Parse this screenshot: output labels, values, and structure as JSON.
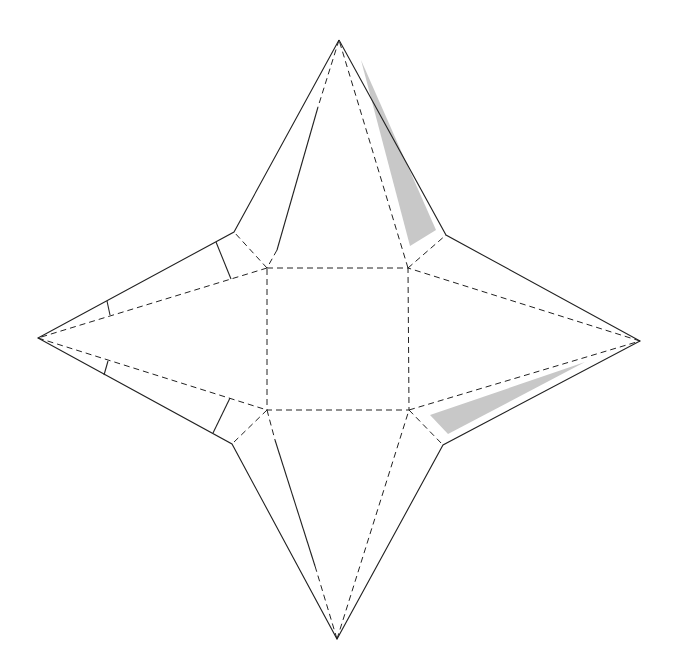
{
  "diagram": {
    "type": "net",
    "colors": {
      "line": "#222222",
      "shade": "#c8c8c8",
      "background": "#ffffff"
    },
    "square": {
      "corners": [
        [
          267,
          268
        ],
        [
          408,
          268
        ],
        [
          409,
          410
        ],
        [
          267,
          410
        ]
      ]
    },
    "tips": {
      "top": [
        339,
        40
      ],
      "right": [
        640,
        341
      ],
      "bottom": [
        337,
        639
      ],
      "left": [
        38,
        338
      ]
    },
    "outer_vertices": {
      "top_left": [
        234,
        232
      ],
      "top_right": [
        446,
        235
      ],
      "bottom_right": [
        443,
        445
      ],
      "bottom_left": [
        232,
        444
      ]
    },
    "shaded_regions": [
      {
        "name": "top-right-glue-flap",
        "points": [
          [
            361,
            60
          ],
          [
            410,
            246
          ],
          [
            436,
            230
          ]
        ]
      },
      {
        "name": "bottom-right-glue-flap",
        "points": [
          [
            430,
            415
          ],
          [
            448,
            434
          ],
          [
            585,
            362
          ]
        ]
      }
    ]
  }
}
